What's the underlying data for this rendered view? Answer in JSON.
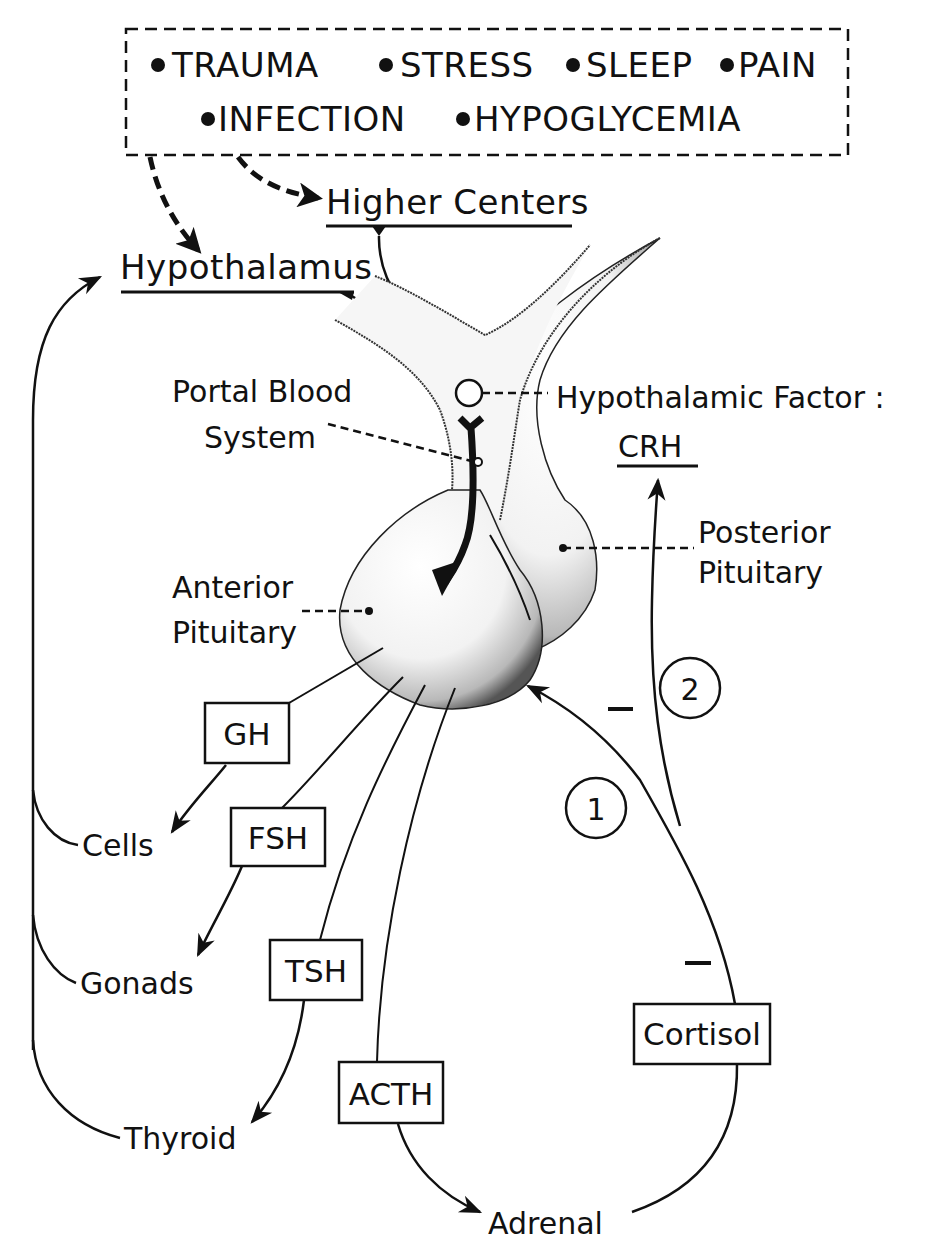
{
  "stimuli": {
    "row1": [
      "TRAUMA",
      "STRESS",
      "SLEEP",
      "PAIN"
    ],
    "row2": [
      "INFECTION",
      "HYPOGLYCEMIA"
    ]
  },
  "labels": {
    "higher_centers": "Higher Centers",
    "hypothalamus": "Hypothalamus",
    "portal_blood_1": "Portal Blood",
    "portal_blood_2": "System",
    "hypothalamic_factor": "Hypothalamic Factor :",
    "crh": "CRH",
    "posterior_1": "Posterior",
    "posterior_2": "Pituitary",
    "anterior_1": "Anterior",
    "anterior_2": "Pituitary",
    "cells": "Cells",
    "gonads": "Gonads",
    "thyroid": "Thyroid",
    "adrenal": "Adrenal"
  },
  "hormones": {
    "gh": "GH",
    "fsh": "FSH",
    "tsh": "TSH",
    "acth": "ACTH",
    "cortisol": "Cortisol"
  },
  "feedback": {
    "loop1": "1",
    "loop2": "2",
    "minus": "–"
  }
}
